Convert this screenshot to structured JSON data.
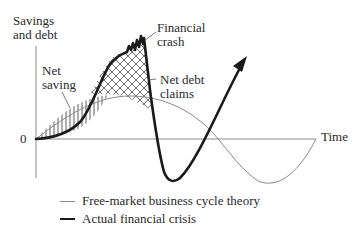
{
  "axes": {
    "y_label_line1": "Savings",
    "y_label_line2": "and debt",
    "x_label": "Time",
    "origin_label": "0"
  },
  "annotations": {
    "financial_crash_line1": "Financial",
    "financial_crash_line2": "crash",
    "net_saving_line1": "Net",
    "net_saving_line2": "saving",
    "net_debt_line1": "Net debt",
    "net_debt_line2": "claims"
  },
  "legend": [
    {
      "label": "Free-market business cycle theory",
      "style": "thin",
      "color": "#8a8a8a"
    },
    {
      "label": "Actual financial crisis",
      "style": "thick",
      "color": "#1a1a1a"
    }
  ],
  "colors": {
    "thin_curve": "#8a8a8a",
    "thick_curve": "#1a1a1a",
    "axis": "#8a8a8a"
  }
}
